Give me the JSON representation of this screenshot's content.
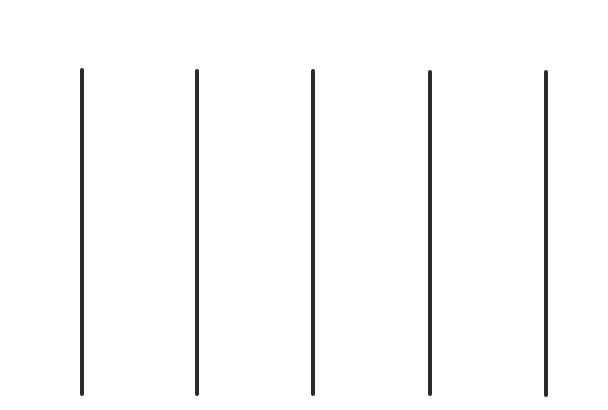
{
  "lines": [
    {
      "x": 82,
      "top": 68,
      "bottom": 396
    },
    {
      "x": 197,
      "top": 69,
      "bottom": 396
    },
    {
      "x": 313,
      "top": 69,
      "bottom": 396
    },
    {
      "x": 430,
      "top": 70,
      "bottom": 396
    },
    {
      "x": 546,
      "top": 70,
      "bottom": 397
    }
  ],
  "color": "#2a2a2a"
}
